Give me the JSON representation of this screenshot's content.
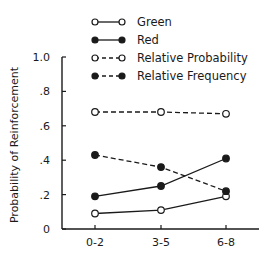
{
  "chart_data": {
    "type": "line",
    "title": "",
    "xlabel": "",
    "ylabel": "Probability of Reinforcement",
    "categories": [
      "0-2",
      "3-5",
      "6-8"
    ],
    "yticks": [
      "0",
      ".2",
      ".4",
      ".6",
      ".8",
      "1.0"
    ],
    "ylim": [
      0,
      1.0
    ],
    "grid": false,
    "legend_position": "top",
    "series": [
      {
        "name": "Green",
        "style": "solid",
        "marker": "open",
        "values": [
          0.09,
          0.11,
          0.19
        ]
      },
      {
        "name": "Red",
        "style": "solid",
        "marker": "filled",
        "values": [
          0.19,
          0.25,
          0.41
        ]
      },
      {
        "name": "Relative Probability",
        "style": "dashed",
        "marker": "open",
        "values": [
          0.68,
          0.68,
          0.67
        ]
      },
      {
        "name": "Relative Frequency",
        "style": "dashed",
        "marker": "filled",
        "values": [
          0.43,
          0.36,
          0.22
        ]
      }
    ]
  },
  "colors": {
    "ink": "#1a1a1a",
    "background": "#ffffff"
  }
}
